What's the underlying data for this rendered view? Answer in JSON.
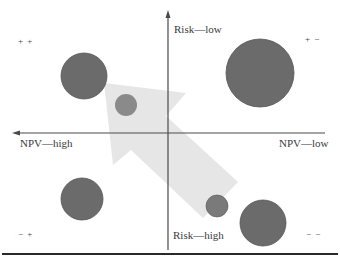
{
  "diagram": {
    "type": "quadrant-bubble",
    "axes": {
      "y_top_label": "Risk—low",
      "y_bottom_label": "Risk—high",
      "x_left_label": "NPV—high",
      "x_right_label": "NPV—low"
    },
    "quadrants": {
      "top_left": "+ +",
      "top_right": "+ −",
      "bottom_left": "− +",
      "bottom_right": "− −"
    },
    "bubbles": [
      {
        "name": "bubble-top-left-large",
        "cx": 84,
        "cy": 76,
        "r": 23,
        "fill": "#6b6b6b"
      },
      {
        "name": "bubble-top-left-small",
        "cx": 126,
        "cy": 105,
        "r": 11,
        "fill": "#8a8a8a"
      },
      {
        "name": "bubble-top-right-large",
        "cx": 260,
        "cy": 73,
        "r": 34,
        "fill": "#6b6b6b"
      },
      {
        "name": "bubble-bottom-left",
        "cx": 82,
        "cy": 199,
        "r": 21,
        "fill": "#6b6b6b"
      },
      {
        "name": "bubble-bottom-right-large",
        "cx": 263,
        "cy": 223,
        "r": 23,
        "fill": "#6b6b6b"
      },
      {
        "name": "bubble-bottom-right-small",
        "cx": 217,
        "cy": 206,
        "r": 11,
        "fill": "#7a7a7a"
      }
    ],
    "arrow": {
      "direction": "toward top-left (lower risk, higher NPV)",
      "fill": "#e6e6e6"
    },
    "colors": {
      "axis": "#4a4a4a",
      "bubble": "#6b6b6b",
      "arrow": "#e6e6e6",
      "rule": "#2a2a2a"
    }
  }
}
